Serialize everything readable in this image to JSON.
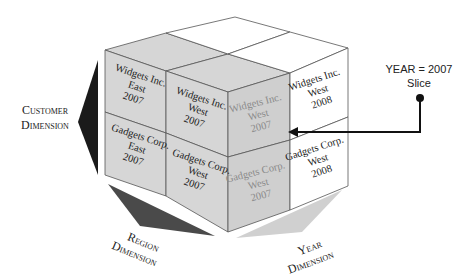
{
  "colors": {
    "gray_face": "#d6d6d6",
    "highlight_face": "#cfcfcf",
    "white_face": "#ffffff",
    "edge": "#555555",
    "customer_arrow": "#1a1a1a",
    "region_arrow": "#4a4a4a",
    "year_arrow": "#d0d0d0",
    "pointer": "#111111"
  },
  "cube": {
    "front_cells": [
      {
        "company": "Widgets Inc.",
        "region": "East",
        "year": "2007"
      },
      {
        "company": "Widgets Inc.",
        "region": "West",
        "year": "2007"
      },
      {
        "company": "Gadgets Corp.",
        "region": "East",
        "year": "2007"
      },
      {
        "company": "Gadgets Corp.",
        "region": "West",
        "year": "2007"
      }
    ],
    "slice_cells": [
      {
        "company": "Widgets Inc.",
        "region": "West",
        "year": "2007"
      },
      {
        "company": "Gadgets Corp.",
        "region": "West",
        "year": "2007"
      }
    ],
    "back_cells": [
      {
        "company": "Widgets Inc.",
        "region": "West",
        "year": "2008"
      },
      {
        "company": "Gadgets Corp.",
        "region": "West",
        "year": "2008"
      }
    ]
  },
  "dimensions": {
    "customer": {
      "line1": "Customer",
      "line2": "Dimension"
    },
    "region": {
      "line1": "Region",
      "line2": "Dimension"
    },
    "year": {
      "line1": "Year",
      "line2": "Dimension"
    }
  },
  "slice_callout": {
    "line1": "YEAR = 2007",
    "line2": "Slice"
  }
}
